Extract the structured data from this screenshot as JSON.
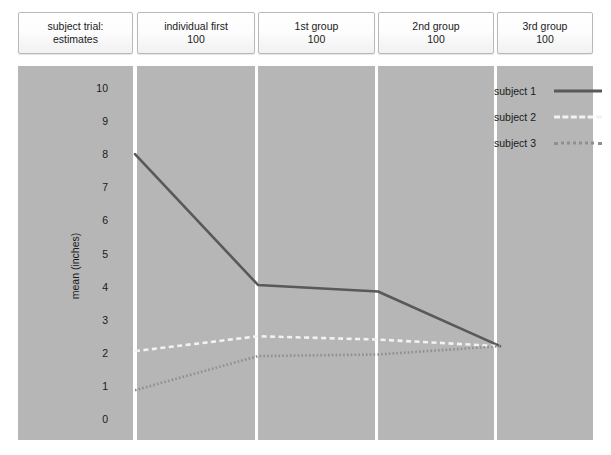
{
  "header": {
    "boxes": [
      {
        "name": "subject-trial",
        "lines": [
          "subject trial:",
          "estimates"
        ]
      },
      {
        "name": "individual-first",
        "lines": [
          "individual first",
          "100"
        ]
      },
      {
        "name": "first-group",
        "lines": [
          "1st group",
          "100"
        ]
      },
      {
        "name": "second-group",
        "lines": [
          "2nd group",
          "100"
        ]
      },
      {
        "name": "third-group",
        "lines": [
          "3rd group",
          "100"
        ]
      }
    ]
  },
  "legend": {
    "position": "top-right",
    "entries": [
      {
        "label": "subject 1",
        "style": "solid",
        "color": "#595959"
      },
      {
        "label": "subject 2",
        "style": "dashed",
        "color": "#f2f2f2"
      },
      {
        "label": "subject 3",
        "style": "dotted",
        "color": "#8f8f8f"
      }
    ]
  },
  "chart_data": {
    "type": "line",
    "title": "",
    "subtitle": "",
    "xlabel": "",
    "ylabel": "mean (inches)",
    "grid": false,
    "legend_position": "top-right",
    "panels": [
      "subject trial: estimates",
      "individual first 100",
      "1st group 100",
      "2nd group 100",
      "3rd group 100"
    ],
    "categories": [
      "individual first 100",
      "1st group 100",
      "2nd group 100",
      "3rd group 100"
    ],
    "ylim": [
      0,
      10
    ],
    "yticks": [
      10,
      9,
      8,
      7,
      6,
      5,
      4,
      3,
      2,
      1,
      0
    ],
    "ytick_labels": [
      "10",
      "9",
      "8",
      "7",
      "6",
      "5",
      "4",
      "3",
      "2",
      "1",
      "0"
    ],
    "series": [
      {
        "name": "subject 1",
        "style": "solid",
        "color": "#595959",
        "values": [
          8.0,
          4.05,
          3.85,
          2.2
        ]
      },
      {
        "name": "subject 2",
        "style": "dashed",
        "color": "#f2f2f2",
        "values": [
          2.05,
          2.5,
          2.4,
          2.2
        ]
      },
      {
        "name": "subject 3",
        "style": "dotted",
        "color": "#8f8f8f",
        "values": [
          0.87,
          1.9,
          1.95,
          2.2
        ]
      }
    ]
  },
  "geometry": {
    "panel_top": 66,
    "panel_height": 374,
    "y_value_top": 88,
    "y_value_bottom": 419,
    "panels_px": [
      {
        "x": 18,
        "w": 115
      },
      {
        "x": 137,
        "w": 118
      },
      {
        "x": 258,
        "w": 117
      },
      {
        "x": 378,
        "w": 116
      },
      {
        "x": 497,
        "w": 96
      }
    ],
    "x_points": [
      135,
      258,
      378,
      500
    ],
    "ytick_label_x": 108,
    "axis_title_x": 75,
    "axis_title_y": 266
  }
}
